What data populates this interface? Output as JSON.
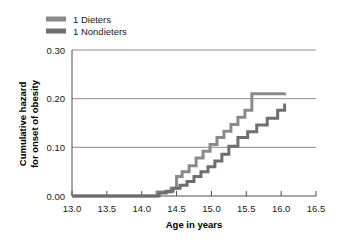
{
  "chart_data": {
    "type": "line",
    "subtype": "step",
    "title": "",
    "xlabel": "Age in years",
    "ylabel": "Cumulative hazard for onset of obesity",
    "ylabel_line1": "Cumulative hazard",
    "ylabel_line2": "for onset of obesity",
    "xlim": [
      13.0,
      16.5
    ],
    "ylim": [
      0.0,
      0.3
    ],
    "xticks": [
      13.0,
      13.5,
      14.0,
      14.5,
      15.0,
      15.5,
      16.0,
      16.5
    ],
    "xtick_labels": [
      "13.0",
      "13.5",
      "14.0",
      "14.5",
      "15.0",
      "15.5",
      "16.0",
      "16.5"
    ],
    "yticks": [
      0.0,
      0.1,
      0.2,
      0.3
    ],
    "ytick_labels": [
      "0.00",
      "0.10",
      "0.20",
      "0.30"
    ],
    "grid": "horizontal",
    "legend_position": "top-left",
    "series": [
      {
        "name": "1 Dieters",
        "color": "#8a8a8a",
        "points_x": [
          13.0,
          14.05,
          14.22,
          14.3,
          14.42,
          14.5,
          14.58,
          14.68,
          14.78,
          14.88,
          14.98,
          15.08,
          15.18,
          15.28,
          15.38,
          15.48,
          15.58,
          16.05
        ],
        "points_y": [
          0.0,
          0.0,
          0.008,
          0.008,
          0.016,
          0.04,
          0.05,
          0.062,
          0.078,
          0.092,
          0.106,
          0.12,
          0.133,
          0.147,
          0.162,
          0.176,
          0.21,
          0.212
        ]
      },
      {
        "name": "1 Nondieters",
        "color": "#6e6e6e",
        "points_x": [
          13.0,
          14.05,
          14.25,
          14.35,
          14.45,
          14.55,
          14.65,
          14.75,
          14.85,
          14.95,
          15.05,
          15.15,
          15.25,
          15.38,
          15.52,
          15.65,
          15.8,
          15.95,
          16.05
        ],
        "points_y": [
          0.0,
          0.0,
          0.006,
          0.01,
          0.016,
          0.022,
          0.03,
          0.04,
          0.05,
          0.06,
          0.072,
          0.086,
          0.102,
          0.12,
          0.132,
          0.146,
          0.16,
          0.176,
          0.19
        ]
      }
    ],
    "legend_entries": [
      {
        "label": "1 Dieters",
        "color": "#8a8a8a"
      },
      {
        "label": "1 Nondieters",
        "color": "#6e6e6e"
      }
    ],
    "colors": {
      "axis": "#4d4d4d",
      "grid": "#808080",
      "text": "#1a1a1a",
      "background": "#ffffff"
    }
  }
}
